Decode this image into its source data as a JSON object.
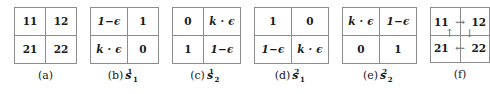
{
  "figure": {
    "panels": [
      {
        "id": "a",
        "caption_label": "(a)",
        "symbol": null,
        "symbol_sub": null,
        "symbol_sup": null,
        "type": "matrix",
        "rows": [
          [
            "11",
            "12"
          ],
          [
            "21",
            "22"
          ]
        ],
        "cell_kinds": [
          [
            "num",
            "num"
          ],
          [
            "num",
            "num"
          ]
        ]
      },
      {
        "id": "b",
        "caption_label": "(b)",
        "symbol": "s",
        "symbol_sub": "1",
        "symbol_sup": "1",
        "type": "matrix",
        "rows": [
          [
            "1−ϵ",
            "1"
          ],
          [
            "k · ϵ",
            "0"
          ]
        ],
        "cell_kinds": [
          [
            "expr",
            "num"
          ],
          [
            "expr",
            "num"
          ]
        ]
      },
      {
        "id": "c",
        "caption_label": "(c)",
        "symbol": "s",
        "symbol_sub": "2",
        "symbol_sup": "1",
        "type": "matrix",
        "rows": [
          [
            "0",
            "k · ϵ"
          ],
          [
            "1",
            "1−ϵ"
          ]
        ],
        "cell_kinds": [
          [
            "num",
            "expr"
          ],
          [
            "num",
            "expr"
          ]
        ]
      },
      {
        "id": "d",
        "caption_label": "(d)",
        "symbol": "s",
        "symbol_sub": "1",
        "symbol_sup": "2",
        "type": "matrix",
        "rows": [
          [
            "1",
            "0"
          ],
          [
            "1−ϵ",
            "k · ϵ"
          ]
        ],
        "cell_kinds": [
          [
            "num",
            "num"
          ],
          [
            "expr",
            "expr"
          ]
        ]
      },
      {
        "id": "e",
        "caption_label": "(e)",
        "symbol": "s",
        "symbol_sub": "2",
        "symbol_sup": "2",
        "type": "matrix",
        "rows": [
          [
            "k · ϵ",
            "1−ϵ"
          ],
          [
            "0",
            "1"
          ]
        ],
        "cell_kinds": [
          [
            "expr",
            "expr"
          ],
          [
            "num",
            "num"
          ]
        ]
      },
      {
        "id": "f",
        "caption_label": "(f)",
        "symbol": null,
        "symbol_sub": null,
        "symbol_sup": null,
        "type": "cycle",
        "nodes": {
          "top_left": "11",
          "top_right": "12",
          "bottom_left": "21",
          "bottom_right": "22"
        },
        "arrows": {
          "top_right_arrow": "→",
          "right_down_arrow": "↓",
          "bottom_left_arrow": "←",
          "left_up_arrow": "↑"
        }
      }
    ]
  },
  "colors": {
    "background": "#ffffff",
    "text": "#1a1a1a",
    "grid_border": "#8d8d8d",
    "arrow": "#6f6f6f"
  }
}
